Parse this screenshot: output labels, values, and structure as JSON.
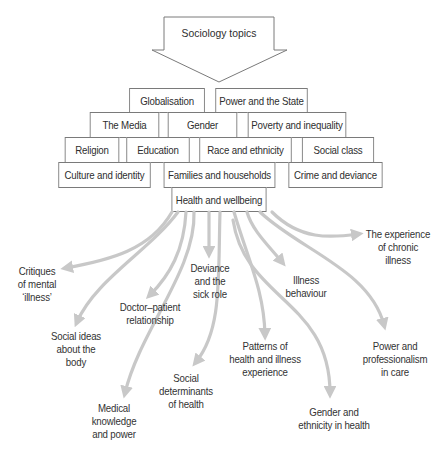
{
  "diagram": {
    "header_arrow": {
      "label": "Sociology topics"
    },
    "topic_rows": [
      [
        "Globalisation",
        "Power and the State"
      ],
      [
        "The Media",
        "Gender",
        "Poverty and inequality"
      ],
      [
        "Religion",
        "Education",
        "Race and ethnicity",
        "Social class"
      ],
      [
        "Culture and identity",
        "Families and households",
        "Crime and deviance"
      ]
    ],
    "focus_topic": "Health and wellbeing",
    "subtopics": [
      "Critiques\nof mental\n‘illness’",
      "Social ideas\nabout the\nbody",
      "Medical\nknowledge\nand power",
      "Doctor–patient\nrelationship",
      "Social\ndeterminants\nof health",
      "Deviance\nand the\nsick role",
      "Patterns of\nhealth and illness\nexperience",
      "Illness\nbehaviour",
      "Gender and\nethnicity in health",
      "Power and\nprofessionalism\nin care",
      "The experience\nof chronic\nillness"
    ],
    "colors": {
      "arrow": "#c8c8c8",
      "border": "#7a7a7a",
      "text": "#333333"
    }
  }
}
